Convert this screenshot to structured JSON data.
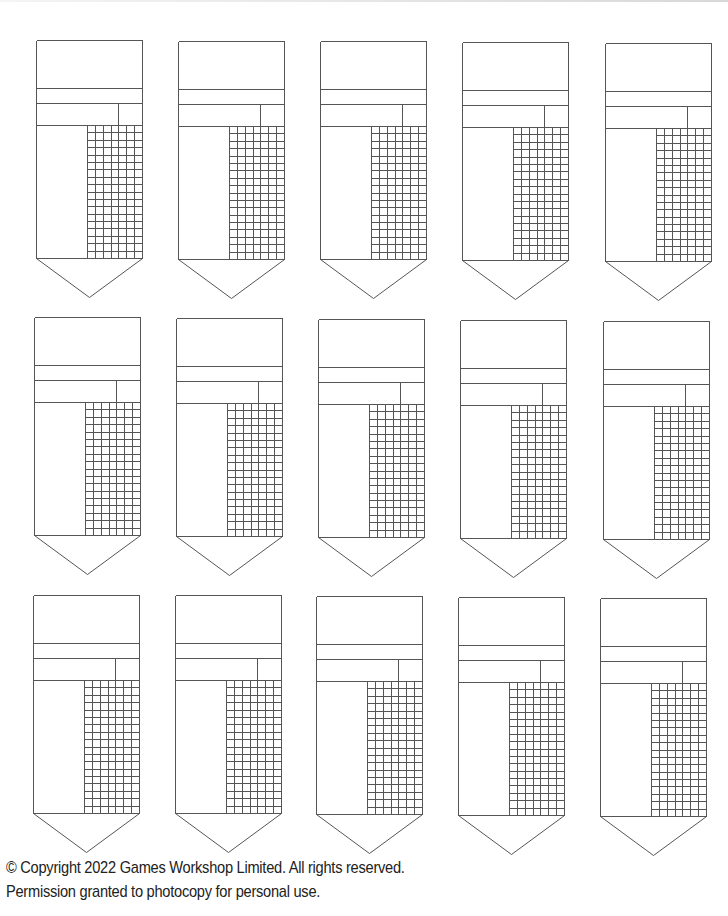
{
  "document": {
    "type": "printable card sheet",
    "rows": 3,
    "columns": 5,
    "card_count": 15,
    "card_layout": {
      "sections": [
        "title-box",
        "band",
        "split-row",
        "left-panel",
        "tally-grid",
        "pointed-tip"
      ],
      "grid_columns": 7,
      "grid_rows": 18
    },
    "line_color": "#555555",
    "cards": [
      {
        "row": 1,
        "col": 1,
        "x": 36,
        "y": 40
      },
      {
        "row": 1,
        "col": 2,
        "x": 178,
        "y": 41
      },
      {
        "row": 1,
        "col": 3,
        "x": 320,
        "y": 41
      },
      {
        "row": 1,
        "col": 4,
        "x": 462,
        "y": 42
      },
      {
        "row": 1,
        "col": 5,
        "x": 605,
        "y": 43
      },
      {
        "row": 2,
        "col": 1,
        "x": 34,
        "y": 317
      },
      {
        "row": 2,
        "col": 2,
        "x": 176,
        "y": 318
      },
      {
        "row": 2,
        "col": 3,
        "x": 318,
        "y": 319
      },
      {
        "row": 2,
        "col": 4,
        "x": 460,
        "y": 320
      },
      {
        "row": 2,
        "col": 5,
        "x": 603,
        "y": 321
      },
      {
        "row": 3,
        "col": 1,
        "x": 33,
        "y": 595
      },
      {
        "row": 3,
        "col": 2,
        "x": 175,
        "y": 595
      },
      {
        "row": 3,
        "col": 3,
        "x": 316,
        "y": 596
      },
      {
        "row": 3,
        "col": 4,
        "x": 458,
        "y": 597
      },
      {
        "row": 3,
        "col": 5,
        "x": 600,
        "y": 598
      }
    ]
  },
  "footer": {
    "copyright": "© Copyright 2022 Games Workshop Limited. All rights reserved.",
    "permission": "Permission granted to photocopy for personal use."
  }
}
